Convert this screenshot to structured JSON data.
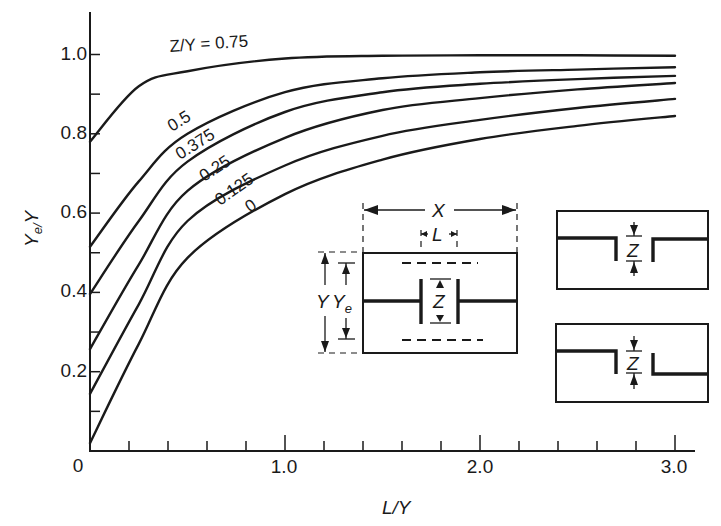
{
  "chart_data": {
    "type": "line",
    "title": "",
    "xlabel": "L/Y",
    "ylabel": "Ye/Y",
    "xlim": [
      0,
      3.0
    ],
    "ylim": [
      0,
      1.1
    ],
    "grid": false,
    "legend_position": "inline curve labels",
    "x_ticks": [
      "0",
      "1.0",
      "2.0",
      "3.0"
    ],
    "x_minor_step": 0.2,
    "y_ticks": [
      "0.2",
      "0.4",
      "0.6",
      "0.8",
      "1.0"
    ],
    "y_minor_step": 0.1,
    "x": [
      0,
      0.25,
      0.5,
      1.0,
      1.5,
      2.0,
      2.5,
      3.0
    ],
    "series": [
      {
        "name": "Z/Y = 0.75",
        "label": "Z/Y = 0.75",
        "values": [
          0.78,
          0.92,
          0.958,
          0.99,
          0.997,
          0.998,
          0.998,
          0.997
        ]
      },
      {
        "name": "Z/Y = 0.5",
        "label": "0.5",
        "values": [
          0.515,
          0.68,
          0.8,
          0.905,
          0.94,
          0.955,
          0.962,
          0.968
        ]
      },
      {
        "name": "Z/Y = 0.375",
        "label": "0.375",
        "values": [
          0.396,
          0.58,
          0.73,
          0.855,
          0.905,
          0.926,
          0.938,
          0.946
        ]
      },
      {
        "name": "Z/Y = 0.25",
        "label": "0.25",
        "values": [
          0.257,
          0.47,
          0.656,
          0.79,
          0.86,
          0.89,
          0.912,
          0.928
        ]
      },
      {
        "name": "Z/Y = 0.125",
        "label": "0.125",
        "values": [
          0.144,
          0.37,
          0.58,
          0.72,
          0.795,
          0.835,
          0.865,
          0.888
        ]
      },
      {
        "name": "Z/Y = 0",
        "label": "0",
        "values": [
          0.02,
          0.27,
          0.487,
          0.648,
          0.735,
          0.787,
          0.82,
          0.845
        ]
      }
    ],
    "annotations": [
      "Inset: waveguide cross-section of width X with inductive/capacitive strip of length L, gap Z, height Y, equivalent height Ye",
      "Inset: symmetric capacitive iris with gap Z",
      "Inset: asymmetric capacitive iris (step) with gap Z"
    ]
  },
  "axes": {
    "x_label": "L/Y",
    "y_label_main": "Y",
    "y_label_sub": "e/",
    "y_label_tail": "Y",
    "x_tick_labels": [
      "0",
      "1.0",
      "2.0",
      "3.0"
    ],
    "y_tick_labels": [
      "0.2",
      "0.4",
      "0.6",
      "0.8",
      "1.0"
    ]
  },
  "curve_labels": [
    "Z/Y = 0.75",
    "0.5",
    "0.375",
    "0.25",
    "0.125",
    "0"
  ],
  "insets": {
    "main": {
      "x_dim": "X",
      "l_dim": "L",
      "z_dim": "Z",
      "y_dim": "Y",
      "ye_main": "Y",
      "ye_sub": "e"
    },
    "symmetric": {
      "z_dim": "Z"
    },
    "asymmetric": {
      "z_dim": "Z"
    }
  }
}
